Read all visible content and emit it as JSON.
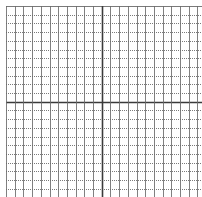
{
  "grid": {
    "origin_x": 6,
    "origin_y": 6,
    "cell_size": 8.7,
    "columns": 23,
    "rows": 22,
    "center_col": 11,
    "center_row": 11,
    "colors": {
      "background": "#ffffff",
      "vertical_line": "#6a6a6a",
      "horizontal_line": "#7a7a7a",
      "axis_line": "#3a3a3a",
      "border": "#8a8a8a"
    },
    "horizontal_style": "dotted",
    "vertical_style": "solid"
  }
}
